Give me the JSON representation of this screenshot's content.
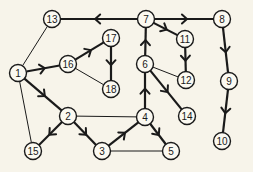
{
  "diagram": {
    "type": "directed-graph",
    "background": "#f7f4ea",
    "stroke_color": "#1a1a1a",
    "nodes": [
      {
        "id": "1",
        "label": "1",
        "x": 18,
        "y": 73
      },
      {
        "id": "2",
        "label": "2",
        "x": 68,
        "y": 116
      },
      {
        "id": "3",
        "label": "3",
        "x": 102,
        "y": 151
      },
      {
        "id": "4",
        "label": "4",
        "x": 145,
        "y": 117
      },
      {
        "id": "5",
        "label": "5",
        "x": 171,
        "y": 151
      },
      {
        "id": "6",
        "label": "6",
        "x": 145,
        "y": 64
      },
      {
        "id": "7",
        "label": "7",
        "x": 146,
        "y": 19
      },
      {
        "id": "8",
        "label": "8",
        "x": 222,
        "y": 19
      },
      {
        "id": "9",
        "label": "9",
        "x": 229,
        "y": 81
      },
      {
        "id": "10",
        "label": "10",
        "x": 222,
        "y": 141
      },
      {
        "id": "11",
        "label": "11",
        "x": 185,
        "y": 39
      },
      {
        "id": "12",
        "label": "12",
        "x": 186,
        "y": 80
      },
      {
        "id": "13",
        "label": "13",
        "x": 52,
        "y": 19
      },
      {
        "id": "14",
        "label": "14",
        "x": 187,
        "y": 116
      },
      {
        "id": "15",
        "label": "15",
        "x": 33,
        "y": 151
      },
      {
        "id": "16",
        "label": "16",
        "x": 68,
        "y": 64
      },
      {
        "id": "17",
        "label": "17",
        "x": 111,
        "y": 38
      },
      {
        "id": "18",
        "label": "18",
        "x": 111,
        "y": 89
      }
    ],
    "edges": [
      {
        "from": "7",
        "to": "13",
        "directed": true
      },
      {
        "from": "7",
        "to": "8",
        "directed": true
      },
      {
        "from": "7",
        "to": "11",
        "directed": true
      },
      {
        "from": "11",
        "to": "12",
        "directed": true
      },
      {
        "from": "8",
        "to": "9",
        "directed": true
      },
      {
        "from": "9",
        "to": "10",
        "directed": true
      },
      {
        "from": "6",
        "to": "7",
        "directed": true
      },
      {
        "from": "4",
        "to": "6",
        "directed": true
      },
      {
        "from": "6",
        "to": "14",
        "directed": true
      },
      {
        "from": "6",
        "to": "12",
        "directed": false
      },
      {
        "from": "1",
        "to": "16",
        "directed": true
      },
      {
        "from": "16",
        "to": "17",
        "directed": true
      },
      {
        "from": "17",
        "to": "18",
        "directed": true
      },
      {
        "from": "16",
        "to": "18",
        "directed": false
      },
      {
        "from": "1",
        "to": "13",
        "directed": false
      },
      {
        "from": "1",
        "to": "2",
        "directed": true
      },
      {
        "from": "1",
        "to": "15",
        "directed": false
      },
      {
        "from": "2",
        "to": "15",
        "directed": true
      },
      {
        "from": "2",
        "to": "3",
        "directed": true
      },
      {
        "from": "3",
        "to": "4",
        "directed": true
      },
      {
        "from": "4",
        "to": "5",
        "directed": true
      },
      {
        "from": "2",
        "to": "4",
        "directed": false
      },
      {
        "from": "3",
        "to": "5",
        "directed": false
      }
    ]
  }
}
